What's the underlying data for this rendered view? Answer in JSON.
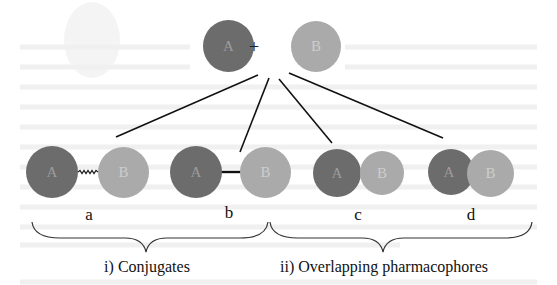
{
  "diagram": {
    "top": {
      "left_circle": "A",
      "operator": "+",
      "right_circle": "B"
    },
    "variants": [
      {
        "id": "a",
        "label": "a",
        "left": "A",
        "right": "B",
        "connection": "wavy-linker"
      },
      {
        "id": "b",
        "label": "b",
        "left": "A",
        "right": "B",
        "connection": "direct-bond"
      },
      {
        "id": "c",
        "label": "c",
        "left": "A",
        "right": "B",
        "connection": "touching"
      },
      {
        "id": "d",
        "label": "d",
        "left": "A",
        "right": "B",
        "connection": "overlapping"
      }
    ],
    "groups": [
      {
        "caption": "i) Conjugates",
        "members": [
          "a",
          "b"
        ]
      },
      {
        "caption": "ii) Overlapping pharmacophores",
        "members": [
          "c",
          "d"
        ]
      }
    ],
    "colors": {
      "circle_a": "#6c6c6c",
      "circle_b": "#aaaaaa",
      "lines": "#111111"
    }
  }
}
